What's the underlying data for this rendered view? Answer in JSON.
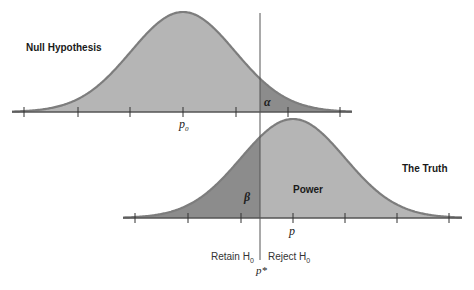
{
  "chart_data": {
    "type": "diagram",
    "title": "",
    "distributions": [
      {
        "name": "Null Hypothesis",
        "center_label": "p0",
        "shaded_tail": "alpha",
        "tail_side": "right"
      },
      {
        "name": "The Truth",
        "center_label": "p",
        "shaded_tail": "beta",
        "tail_side": "left",
        "complement": "Power"
      }
    ],
    "critical_value_label": "p*",
    "decision_regions": [
      "Retain H0",
      "Reject H0"
    ],
    "colors": {
      "light_fill": "#b5b5b5",
      "dark_fill": "#8c8c8c",
      "outline": "#7d7d7d",
      "axis": "#555555"
    }
  },
  "labels": {
    "null_title": "Null Hypothesis",
    "truth_title": "The Truth",
    "alpha": "α",
    "beta": "β",
    "power": "Power",
    "p0_main": "p",
    "p0_sub": "0",
    "p_main": "p",
    "pstar": "p*",
    "retain": "Retain H",
    "retain_sub": "0",
    "reject": "Reject H",
    "reject_sub": "0"
  }
}
